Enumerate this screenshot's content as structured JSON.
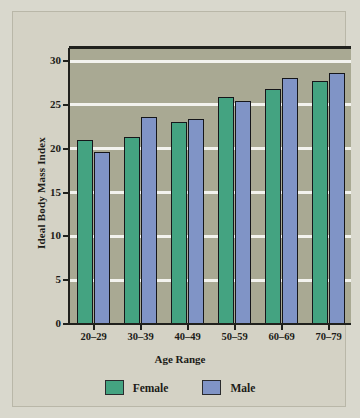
{
  "chart_data": {
    "type": "bar",
    "title": "",
    "xlabel": "Age Range",
    "ylabel": "Ideal Body Mass Index",
    "categories": [
      "20–29",
      "30–39",
      "40–49",
      "50–59",
      "60–69",
      "70–79"
    ],
    "series": [
      {
        "name": "Female",
        "color": "#44a381",
        "values": [
          21.0,
          21.4,
          23.1,
          25.9,
          26.8,
          27.7
        ]
      },
      {
        "name": "Male",
        "color": "#8094c6",
        "values": [
          19.6,
          23.6,
          23.4,
          25.4,
          28.1,
          28.7
        ]
      }
    ],
    "ylim": [
      0,
      31.5
    ],
    "yticks": [
      0,
      5,
      10,
      15,
      20,
      25,
      30
    ],
    "ytick_labels": [
      "0",
      "5",
      "10",
      "15",
      "20",
      "25",
      "30"
    ],
    "gridlines": [
      5,
      10,
      15,
      20,
      25,
      30
    ],
    "grid": true,
    "legend_position": "bottom",
    "legend": [
      "Female",
      "Male"
    ],
    "plot_background": "#a9a993",
    "figure_background": "#d4d2c5",
    "gridline_color": "#f3f3ee",
    "axis_color": "#20211d"
  }
}
